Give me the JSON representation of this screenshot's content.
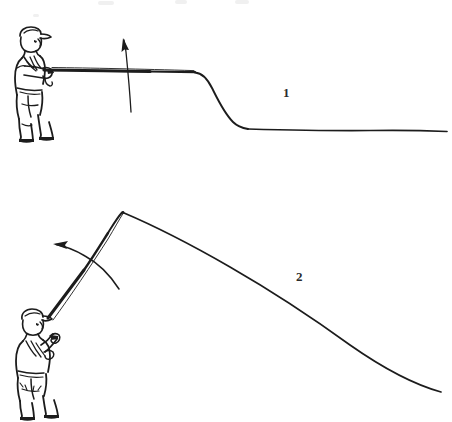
{
  "figure": {
    "background_color": "#ffffff",
    "ink_color": "#1c1c1c",
    "width": 452,
    "height": 422,
    "panel_count": 2
  },
  "panels": [
    {
      "number": "1",
      "number_position": {
        "x": 283,
        "y": 85
      },
      "caption": "",
      "angler": {
        "name": "angler-figure-1",
        "pose": "standing, facing right, rod held low and horizontal",
        "hat": "flat cap",
        "position": {
          "x": 12,
          "y": 28,
          "width": 50,
          "height": 115
        }
      },
      "rod": {
        "name": "fishing-rod-1",
        "orientation": "horizontal",
        "tip": {
          "x": 195,
          "y": 72
        },
        "butt": {
          "x": 44,
          "y": 70
        }
      },
      "line": {
        "name": "fishing-line-1",
        "shape": "drops from rod tip then runs flat to the right edge",
        "start": {
          "x": 195,
          "y": 73
        },
        "end": {
          "x": 447,
          "y": 131
        }
      },
      "arrow": {
        "name": "motion-arrow-up",
        "direction": "up",
        "label": "",
        "from": {
          "x": 131,
          "y": 112
        },
        "to": {
          "x": 123,
          "y": 39
        }
      }
    },
    {
      "number": "2",
      "number_position": {
        "x": 296,
        "y": 269
      },
      "caption": "",
      "angler": {
        "name": "angler-figure-2",
        "pose": "standing, rod raised high with both hands, wearing waders",
        "hat": "flat cap",
        "position": {
          "x": 14,
          "y": 305,
          "width": 52,
          "height": 112
        }
      },
      "rod": {
        "name": "fishing-rod-2",
        "orientation": "raised, tip high and slightly bent",
        "tip": {
          "x": 122,
          "y": 212
        },
        "butt": {
          "x": 48,
          "y": 318
        }
      },
      "line": {
        "name": "fishing-line-2",
        "shape": "long sweeping curve from rod tip down to the lower right",
        "start": {
          "x": 124,
          "y": 213
        },
        "end": {
          "x": 441,
          "y": 392
        }
      },
      "arrow": {
        "name": "motion-arrow-left",
        "direction": "left, curving",
        "label": "",
        "from": {
          "x": 118,
          "y": 288
        },
        "to": {
          "x": 54,
          "y": 245
        }
      }
    }
  ]
}
